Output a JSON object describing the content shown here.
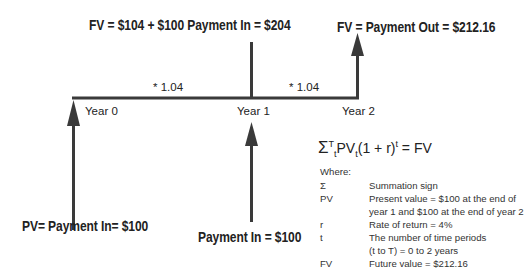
{
  "diagram": {
    "title_top_middle": "FV = $104 + $100 Payment In = $204",
    "title_top_right": "FV = Payment Out = $212.16",
    "growth_labels": [
      "* 1.04",
      "* 1.04"
    ],
    "year_labels": [
      "Year 0",
      "Year 1",
      "Year 2"
    ],
    "bottom_left_label": "PV= Payment In= $100",
    "bottom_middle_label": "Payment In = $100",
    "line_color": "#3a3a3a"
  },
  "formula": {
    "sigma": "Σ",
    "sup_T": "T",
    "sub_t": "t",
    "pv": "PV",
    "sub_t2": "t",
    "paren": "(1 + r)",
    "sup_t": "t",
    "rhs": " = FV"
  },
  "legend": {
    "heading": "Where:",
    "rows": [
      {
        "symbol": "Σ",
        "description": "Summation sign"
      },
      {
        "symbol": "PV",
        "description": "Present value = $100 at the end of"
      },
      {
        "symbol": "",
        "description": "year 1 and $100 at the end of year 2"
      },
      {
        "symbol": "r",
        "description": "Rate of return = 4%"
      },
      {
        "symbol": "t",
        "description": "The number of time periods"
      },
      {
        "symbol": "",
        "description": "(t to T) = 0 to 2 years"
      },
      {
        "symbol": "FV",
        "description": "Future value = $212.16"
      }
    ]
  }
}
